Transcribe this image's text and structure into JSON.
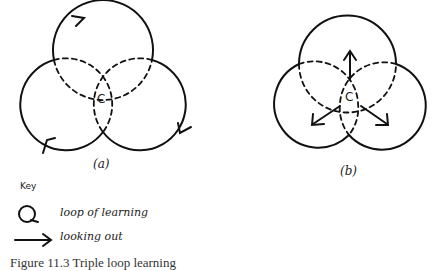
{
  "diagram_a": {
    "label": "(a)",
    "center_label": "C",
    "description": "three overlapping loops with directional arrows on outer boundary"
  },
  "diagram_b": {
    "label": "(b)",
    "center_label": "C",
    "description": "three overlapping loops with arrows pointing outward from centre"
  },
  "key": {
    "title": "Key",
    "items": [
      {
        "icon": "loop-icon",
        "label": "loop of learning"
      },
      {
        "icon": "arrow-right-icon",
        "label": "looking out"
      }
    ]
  },
  "caption": "Figure 11.3 Triple loop learning"
}
